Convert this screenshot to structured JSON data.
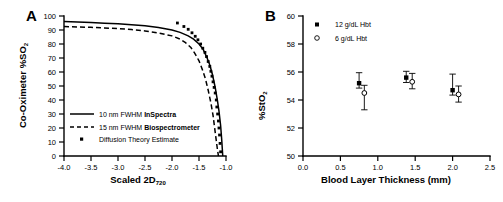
{
  "figure": {
    "width": 503,
    "height": 202,
    "background": "#ffffff",
    "ink": "#000000"
  },
  "panels": {
    "a": {
      "label": "A",
      "ylabel_main": "Co-Oximeter %SO",
      "ylabel_sub": "2",
      "xlabel_main": "Scaled 2D",
      "xlabel_sub": "720",
      "legend": [
        {
          "marker": "solid-line",
          "prefix": "10 nm FWHM ",
          "bold": "InSpectra"
        },
        {
          "marker": "dashed-line",
          "prefix": "15 nm FWHM ",
          "bold": "Biospectrometer"
        },
        {
          "marker": "filled-square",
          "prefix": "Diffusion Theory Estimate",
          "bold": ""
        }
      ]
    },
    "b": {
      "label": "B",
      "ylabel_main": "%StO",
      "ylabel_sub": "2",
      "xlabel": "Blood Layer Thickness (mm)",
      "legend": [
        {
          "marker": "filled-square",
          "label": "12 g/dL Hbt"
        },
        {
          "marker": "open-circle",
          "label": "6 g/dL Hbt"
        }
      ]
    }
  },
  "chart_data": [
    {
      "type": "line",
      "panel": "A",
      "title": "",
      "xlabel": "Scaled 2D720",
      "ylabel": "Co-Oximeter %SO2",
      "xlim": [
        -4.0,
        -1.0
      ],
      "ylim": [
        0,
        100
      ],
      "xticks": [
        "-4.0",
        "-3.5",
        "-3.0",
        "-2.5",
        "-2.0",
        "-1.5",
        "-1.0"
      ],
      "xtick_values": [
        -4.0,
        -3.5,
        -3.0,
        -2.5,
        -2.0,
        -1.5,
        -1.0
      ],
      "yticks": [
        "0",
        "10",
        "20",
        "30",
        "40",
        "50",
        "60",
        "70",
        "80",
        "90",
        "100"
      ],
      "ytick_values": [
        0,
        10,
        20,
        30,
        40,
        50,
        60,
        70,
        80,
        90,
        100
      ],
      "grid": false,
      "legend_position": "lower-left",
      "series": [
        {
          "name": "10 nm FWHM InSpectra",
          "style": "solid",
          "x": [
            -4.0,
            -3.75,
            -3.5,
            -3.25,
            -3.0,
            -2.75,
            -2.5,
            -2.25,
            -2.0,
            -1.85,
            -1.7,
            -1.6,
            -1.5,
            -1.42,
            -1.35,
            -1.3,
            -1.25,
            -1.2,
            -1.16,
            -1.13,
            -1.1,
            -1.08,
            -1.06
          ],
          "y": [
            96.0,
            95.7,
            95.3,
            94.9,
            94.4,
            93.8,
            93.0,
            91.8,
            90.0,
            88.3,
            85.8,
            83.5,
            80.0,
            76.0,
            70.0,
            65.0,
            58.0,
            49.0,
            40.0,
            32.0,
            22.0,
            12.0,
            0.0
          ]
        },
        {
          "name": "15 nm FWHM Biospectrometer",
          "style": "dashed",
          "x": [
            -4.0,
            -3.75,
            -3.5,
            -3.25,
            -3.0,
            -2.75,
            -2.5,
            -2.25,
            -2.0,
            -1.85,
            -1.75,
            -1.65,
            -1.58,
            -1.5,
            -1.44,
            -1.38,
            -1.33,
            -1.28,
            -1.24,
            -1.21,
            -1.18,
            -1.16,
            -1.14
          ],
          "y": [
            92.5,
            92.2,
            91.9,
            91.5,
            91.0,
            90.3,
            89.3,
            87.8,
            85.8,
            83.5,
            81.0,
            77.5,
            73.5,
            68.0,
            62.0,
            55.0,
            47.0,
            38.0,
            29.0,
            20.0,
            11.0,
            5.0,
            0.0
          ]
        },
        {
          "name": "Diffusion Theory Estimate",
          "style": "points",
          "x": [
            -1.9,
            -1.78,
            -1.7,
            -1.63,
            -1.57,
            -1.52,
            -1.47,
            -1.43,
            -1.39,
            -1.36,
            -1.33,
            -1.3,
            -1.28,
            -1.26,
            -1.24,
            -1.22,
            -1.2,
            -1.18,
            -1.17,
            -1.155,
            -1.14,
            -1.13,
            -1.12,
            -1.11,
            -1.1
          ],
          "y": [
            95.0,
            92.5,
            90.5,
            88.0,
            85.5,
            83.0,
            80.0,
            77.0,
            74.0,
            71.0,
            67.5,
            64.0,
            60.5,
            57.0,
            53.0,
            49.0,
            45.0,
            40.0,
            35.0,
            30.0,
            25.0,
            20.0,
            15.0,
            9.0,
            3.0
          ]
        }
      ]
    },
    {
      "type": "scatter",
      "panel": "B",
      "title": "",
      "xlabel": "Blood Layer Thickness (mm)",
      "ylabel": "%StO2",
      "xlim": [
        0.0,
        2.5
      ],
      "ylim": [
        50,
        60
      ],
      "xticks": [
        "0.0",
        "0.5",
        "1.0",
        "1.5",
        "2.0",
        "2.5"
      ],
      "xtick_values": [
        0.0,
        0.5,
        1.0,
        1.5,
        2.0,
        2.5
      ],
      "yticks": [
        "50",
        "52",
        "54",
        "56",
        "58",
        "60"
      ],
      "ytick_values": [
        50,
        52,
        54,
        56,
        58,
        60
      ],
      "grid": false,
      "legend_position": "upper-left",
      "series": [
        {
          "name": "12 g/dL Hbt",
          "marker": "filled-square",
          "x": [
            0.75,
            1.38,
            2.0
          ],
          "y": [
            55.2,
            55.6,
            54.7
          ],
          "yerr_upper": [
            0.75,
            0.45,
            1.15
          ],
          "yerr_lower": [
            0.35,
            0.35,
            0.35
          ]
        },
        {
          "name": "6 g/dL Hbt",
          "marker": "open-circle",
          "x": [
            0.82,
            1.46,
            2.08
          ],
          "y": [
            54.5,
            55.3,
            54.4
          ],
          "yerr_upper": [
            0.55,
            0.6,
            0.6
          ],
          "yerr_lower": [
            1.2,
            0.5,
            0.55
          ]
        }
      ]
    }
  ]
}
